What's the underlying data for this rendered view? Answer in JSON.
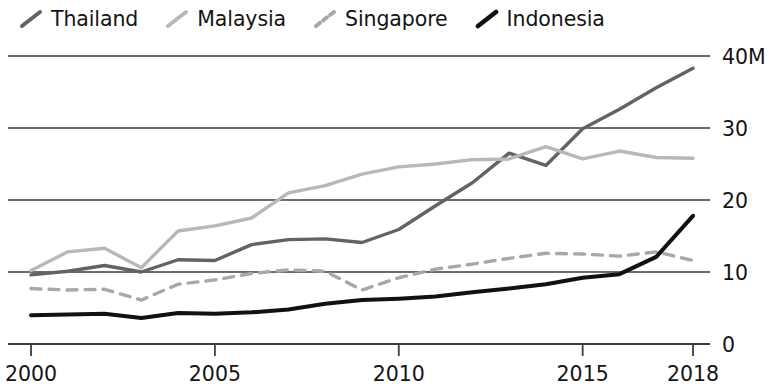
{
  "chart_data": {
    "type": "line",
    "title": "",
    "xlabel": "",
    "ylabel": "",
    "units_suffix": "M",
    "grid": true,
    "grid_axis": "y",
    "legend_position": "top-left",
    "xlim": [
      2000,
      2018
    ],
    "ylim": [
      0,
      40
    ],
    "x_ticks": [
      2000,
      2005,
      2010,
      2015,
      2018
    ],
    "x_tick_labels": [
      "2000",
      "2005",
      "2010",
      "2015",
      "2018"
    ],
    "y_ticks": [
      0,
      10,
      20,
      30,
      40
    ],
    "y_tick_labels": [
      "0",
      "10",
      "20",
      "30",
      "40M"
    ],
    "x": [
      2000,
      2001,
      2002,
      2003,
      2004,
      2005,
      2006,
      2007,
      2008,
      2009,
      2010,
      2011,
      2012,
      2013,
      2014,
      2015,
      2016,
      2017,
      2018
    ],
    "series": [
      {
        "name": "Thailand",
        "color": "#636363",
        "style": "solid",
        "width": 3.4,
        "values": [
          9.6,
          10.1,
          10.9,
          10.0,
          11.7,
          11.6,
          13.8,
          14.5,
          14.6,
          14.1,
          15.9,
          19.2,
          22.4,
          26.5,
          24.8,
          29.9,
          32.6,
          35.6,
          38.3
        ],
        "values_end_year": 2018
      },
      {
        "name": "Malaysia",
        "color": "#b8b8b8",
        "style": "solid",
        "width": 3.4,
        "values": [
          10.2,
          12.8,
          13.3,
          10.6,
          15.7,
          16.4,
          17.5,
          21.0,
          22.0,
          23.6,
          24.6,
          25.0,
          25.6,
          25.7,
          27.4,
          25.7,
          26.8,
          25.9,
          25.8
        ],
        "values_end_year": 2018
      },
      {
        "name": "Singapore",
        "color": "#a8a8a8",
        "style": "dashed",
        "width": 3.4,
        "values": [
          7.7,
          7.5,
          7.6,
          6.1,
          8.3,
          8.9,
          9.8,
          10.3,
          10.1,
          7.5,
          9.2,
          10.4,
          11.1,
          11.9,
          12.6,
          12.5,
          12.2,
          12.8,
          11.6
        ],
        "values_end_year": 2018
      },
      {
        "name": "Indonesia",
        "color": "#111111",
        "style": "solid",
        "width": 4.0,
        "values": [
          4.0,
          4.1,
          4.2,
          3.6,
          4.3,
          4.2,
          4.4,
          4.8,
          5.6,
          6.1,
          6.3,
          6.6,
          7.2,
          7.7,
          8.3,
          9.2,
          9.7,
          12.1,
          17.8
        ],
        "values_end_year": 2018
      }
    ],
    "legend": [
      {
        "label": "Thailand",
        "color": "#636363",
        "style": "solid"
      },
      {
        "label": "Malaysia",
        "color": "#b8b8b8",
        "style": "solid"
      },
      {
        "label": "Singapore",
        "color": "#a8a8a8",
        "style": "dashed"
      },
      {
        "label": "Indonesia",
        "color": "#111111",
        "style": "solid"
      }
    ],
    "axis_color": "#3d3d3d",
    "grid_color": "#3d3d3d",
    "background": "#ffffff"
  }
}
